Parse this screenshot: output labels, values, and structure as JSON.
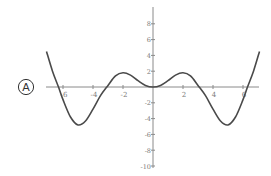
{
  "choice": {
    "letter": "A"
  },
  "colors": {
    "axis": "#8a8a8a",
    "curve": "#4a4a4a",
    "text": "#7a7a7a",
    "background": "#ffffff"
  },
  "chart_data": {
    "type": "line",
    "title": "",
    "xlabel": "",
    "ylabel": "",
    "xlim": [
      -7.2,
      7.2
    ],
    "ylim": [
      -10,
      10
    ],
    "grid": false,
    "legend": null,
    "x_ticks": [
      -6,
      -4,
      -2,
      2,
      4,
      6
    ],
    "x_tick_labels": [
      "-6",
      "-4",
      "-2",
      "2",
      "4",
      "6"
    ],
    "y_ticks": [
      8,
      6,
      4,
      2,
      -2,
      -4,
      -6,
      -8,
      -10
    ],
    "y_tick_labels": [
      "8",
      "6",
      "4",
      "2",
      "-2",
      "-4",
      "-6",
      "-8",
      "-10"
    ],
    "series": [
      {
        "name": "f(x)",
        "x": [
          -7.1,
          -6.7,
          -6.3,
          -6.0,
          -5.5,
          -5.0,
          -4.5,
          -4.0,
          -3.5,
          -3.0,
          -2.5,
          -2.0,
          -1.5,
          -1.0,
          -0.5,
          0.0,
          0.5,
          1.0,
          1.5,
          2.0,
          2.5,
          3.0,
          3.5,
          4.0,
          4.5,
          5.0,
          5.5,
          6.0,
          6.3,
          6.7,
          7.1
        ],
        "y": [
          4.5,
          2.0,
          0.0,
          -1.6,
          -3.8,
          -4.8,
          -4.3,
          -2.8,
          -1.1,
          0.2,
          1.4,
          1.8,
          1.5,
          0.8,
          0.2,
          0.0,
          0.2,
          0.8,
          1.5,
          1.8,
          1.4,
          0.2,
          -1.1,
          -2.8,
          -4.3,
          -4.8,
          -3.8,
          -1.6,
          0.0,
          2.0,
          4.5
        ]
      }
    ]
  }
}
